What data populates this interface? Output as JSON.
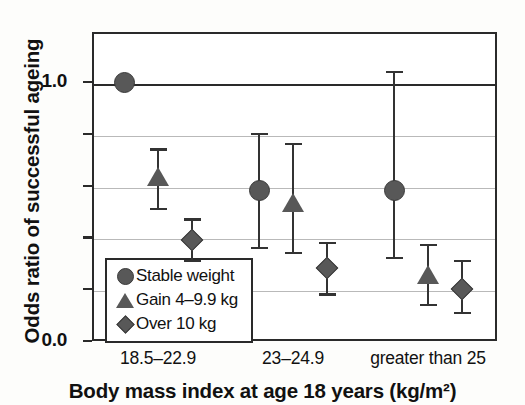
{
  "chart_data": {
    "type": "scatter",
    "title": "",
    "xlabel": "Body mass index at age 18 years (kg/m²)",
    "ylabel": "Odds ratio of successful ageing",
    "categories": [
      "18.5–22.9",
      "23–24.9",
      "greater than 25"
    ],
    "ylim": [
      0.0,
      1.19
    ],
    "yticks": [
      0.0,
      0.2,
      0.4,
      0.6,
      0.8,
      1.0
    ],
    "ytick_labels": [
      "0.0",
      "",
      "",
      "",
      "",
      "1.0"
    ],
    "grid": "horizontal",
    "legend_position": "lower-left-inside",
    "error_bar_type": "95% confidence interval",
    "series": [
      {
        "name": "Stable weight",
        "marker": "circle",
        "values": [
          1.0,
          0.58,
          0.58
        ],
        "ci_low": [
          null,
          0.36,
          0.32
        ],
        "ci_high": [
          null,
          0.8,
          1.04
        ],
        "reference": [
          true,
          false,
          false
        ]
      },
      {
        "name": "Gain 4–9.9 kg",
        "marker": "triangle",
        "values": [
          0.63,
          0.53,
          0.25
        ],
        "ci_low": [
          0.51,
          0.34,
          0.14
        ],
        "ci_high": [
          0.74,
          0.76,
          0.37
        ]
      },
      {
        "name": "Over 10 kg",
        "marker": "diamond",
        "values": [
          0.39,
          0.28,
          0.2
        ],
        "ci_low": [
          0.31,
          0.18,
          0.11
        ],
        "ci_high": [
          0.47,
          0.38,
          0.31
        ]
      }
    ]
  },
  "legend": {
    "items": [
      {
        "label": "Stable weight",
        "symbol": "circle-marker"
      },
      {
        "label": "Gain 4–9.9 kg",
        "symbol": "triangle-marker"
      },
      {
        "label": "Over 10 kg",
        "symbol": "diamond-marker"
      }
    ]
  },
  "colors": {
    "marker": "#585858",
    "axis": "#2a2a2a",
    "grid": "#b9b9b9",
    "background": "#fdfdfb"
  }
}
